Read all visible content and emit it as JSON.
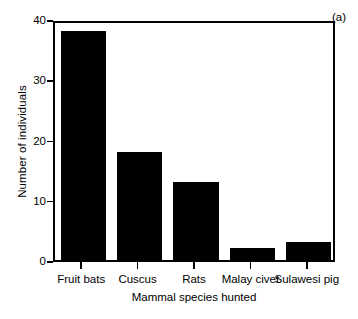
{
  "chart_data": {
    "type": "bar",
    "title": "",
    "panel_label": "(a)",
    "xlabel": "Mammal species hunted",
    "ylabel": "Number of individuals",
    "categories": [
      "Fruit bats",
      "Cuscus",
      "Rats",
      "Malay civet",
      "Sulawesi pig"
    ],
    "values": [
      38,
      18,
      13,
      2,
      3
    ],
    "ylim": [
      0,
      40
    ],
    "yticks": [
      0,
      10,
      20,
      30,
      40
    ],
    "ytick_labels": [
      "0",
      "10",
      "20",
      "30",
      "40"
    ],
    "grid": false,
    "legend": false,
    "bar_color": "#000000",
    "background_color": "#ffffff",
    "axis_color": "#000000"
  }
}
